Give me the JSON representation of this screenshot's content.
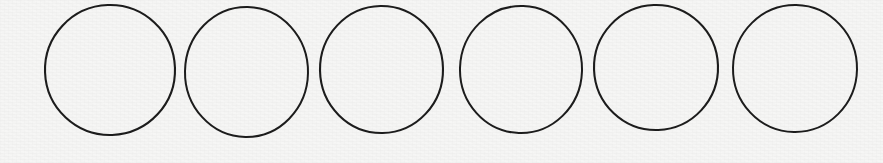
{
  "canvas": {
    "width": 883,
    "height": 163,
    "background_color": "#f6f6f5",
    "texture": "paper-scan-grain"
  },
  "figure": {
    "shape_count": 6,
    "shape_kind": "circle",
    "fill": "none",
    "stroke_color": "#1c1c1c",
    "stroke_width": 2,
    "style": "hand-drawn"
  },
  "shapes": [
    {
      "name": "circle-1",
      "index": 1,
      "cx": 110,
      "cy": 70,
      "rx": 65,
      "ry": 65,
      "left": 45,
      "top": 5,
      "right": 175,
      "bottom": 135,
      "stroke_width": 2.1,
      "rotation": -2
    },
    {
      "name": "circle-2",
      "index": 2,
      "cx": 246.5,
      "cy": 72,
      "rx": 61.5,
      "ry": 65,
      "left": 185,
      "top": 7,
      "right": 308,
      "bottom": 137,
      "stroke_width": 2.0,
      "rotation": 1
    },
    {
      "name": "circle-3",
      "index": 3,
      "cx": 381.5,
      "cy": 69.5,
      "rx": 61.5,
      "ry": 63.5,
      "left": 320,
      "top": 6,
      "right": 443,
      "bottom": 133,
      "stroke_width": 2.1,
      "rotation": -1
    },
    {
      "name": "circle-4",
      "index": 4,
      "cx": 521,
      "cy": 69.5,
      "rx": 61,
      "ry": 63.5,
      "left": 460,
      "top": 6,
      "right": 582,
      "bottom": 133,
      "stroke_width": 2.0,
      "rotation": 2
    },
    {
      "name": "circle-5",
      "index": 5,
      "cx": 656,
      "cy": 67.5,
      "rx": 62,
      "ry": 62.5,
      "left": 594,
      "top": 5,
      "right": 718,
      "bottom": 130,
      "stroke_width": 2.1,
      "rotation": -2
    },
    {
      "name": "circle-6",
      "index": 6,
      "cx": 795,
      "cy": 68.5,
      "rx": 62,
      "ry": 63.5,
      "left": 733,
      "top": 5,
      "right": 857,
      "bottom": 132,
      "stroke_width": 2.0,
      "rotation": 1
    }
  ]
}
